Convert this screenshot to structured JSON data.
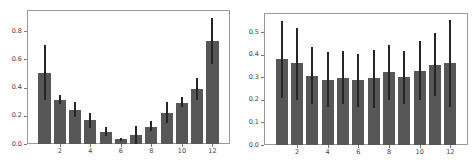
{
  "chart_data": [
    {
      "type": "bar",
      "title": "",
      "xlabel": "",
      "ylabel": "",
      "categories": [
        1,
        2,
        3,
        4,
        5,
        6,
        7,
        8,
        9,
        10,
        11,
        12
      ],
      "values": [
        0.5,
        0.31,
        0.24,
        0.17,
        0.085,
        0.035,
        0.065,
        0.12,
        0.22,
        0.29,
        0.39,
        0.73
      ],
      "error_low": [
        0.31,
        0.28,
        0.19,
        0.11,
        0.06,
        0.02,
        0.0,
        0.09,
        0.15,
        0.26,
        0.31,
        0.57
      ],
      "error_high": [
        0.7,
        0.35,
        0.3,
        0.22,
        0.12,
        0.045,
        0.13,
        0.16,
        0.3,
        0.33,
        0.47,
        0.89
      ],
      "xticks": [
        2,
        4,
        6,
        8,
        10,
        12
      ],
      "yticks": [
        0.0,
        0.2,
        0.4,
        0.6,
        0.8
      ],
      "ytick_labels": [
        "0.0",
        "0.2",
        "0.4",
        "0.6",
        "0.8"
      ],
      "xtick_labels": [
        "2",
        "4",
        "6",
        "8",
        "10",
        "12"
      ],
      "xlim": [
        -0.15,
        13.15
      ],
      "ylim": [
        0,
        0.95
      ],
      "grid": false,
      "bar_color": "#575757",
      "error_color": "#262626"
    },
    {
      "type": "bar",
      "title": "",
      "xlabel": "",
      "ylabel": "",
      "categories": [
        1,
        2,
        3,
        4,
        5,
        6,
        7,
        8,
        9,
        10,
        11,
        12
      ],
      "values": [
        0.38,
        0.365,
        0.305,
        0.29,
        0.295,
        0.29,
        0.295,
        0.325,
        0.3,
        0.33,
        0.355,
        0.365
      ],
      "error_low": [
        0.21,
        0.2,
        0.18,
        0.17,
        0.18,
        0.17,
        0.165,
        0.2,
        0.18,
        0.2,
        0.215,
        0.17
      ],
      "error_high": [
        0.55,
        0.52,
        0.435,
        0.41,
        0.415,
        0.405,
        0.42,
        0.445,
        0.415,
        0.46,
        0.495,
        0.555
      ],
      "xticks": [
        2,
        4,
        6,
        8,
        10,
        12
      ],
      "yticks": [
        0.0,
        0.1,
        0.2,
        0.3,
        0.4,
        0.5
      ],
      "ytick_labels": [
        "0.0",
        "0.1",
        "0.2",
        "0.3",
        "0.4",
        "0.5"
      ],
      "xtick_labels": [
        "2",
        "4",
        "6",
        "8",
        "10",
        "12"
      ],
      "xlim": [
        -0.15,
        13.15
      ],
      "ylim": [
        0,
        0.585
      ],
      "grid": false,
      "bar_color": "#575757",
      "error_color": "#262626"
    }
  ]
}
